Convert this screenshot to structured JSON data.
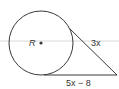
{
  "figure": {
    "circle": {
      "label": "R",
      "center": "center-dot"
    },
    "tangent_upper": {
      "label": "3x"
    },
    "tangent_lower": {
      "label": "5x − 8"
    },
    "colors": {
      "stroke": "#3a3a3a",
      "text": "#333333",
      "band": "#e6e6e6"
    }
  }
}
